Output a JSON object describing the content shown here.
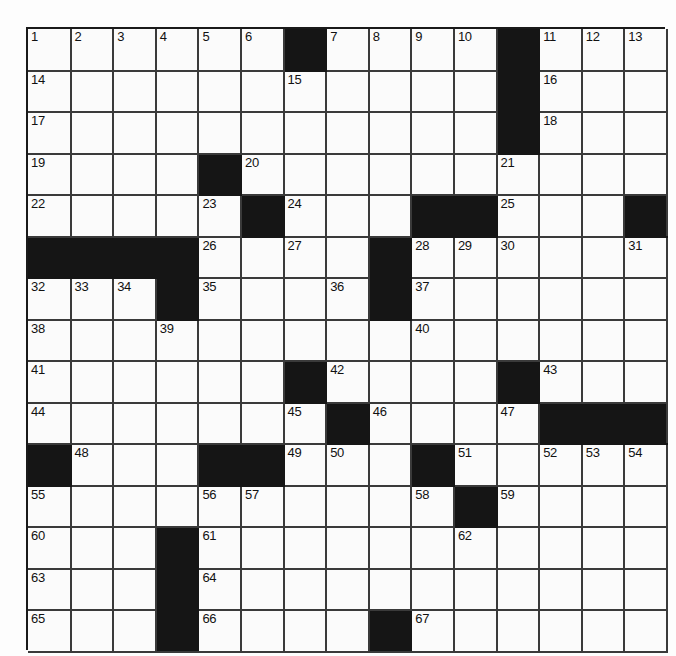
{
  "puzzle": {
    "title": "Crossword Puzzle Grid",
    "rows": 15,
    "cols": 15,
    "colors": {
      "block": "#151515",
      "cell": "#fbfbfb",
      "grid_line": "#3a3a3a",
      "page_background": "#ffffff",
      "number_text": "#111111"
    },
    "highest_number": 67,
    "grid": [
      [
        {
          "n": "1"
        },
        {
          "n": "2"
        },
        {
          "n": "3"
        },
        {
          "n": "4"
        },
        {
          "n": "5"
        },
        {
          "n": "6"
        },
        {
          "b": true
        },
        {
          "n": "7"
        },
        {
          "n": "8"
        },
        {
          "n": "9"
        },
        {
          "n": "10"
        },
        {
          "b": true
        },
        {
          "n": "11"
        },
        {
          "n": "12"
        },
        {
          "n": "13"
        }
      ],
      [
        {
          "n": "14"
        },
        {},
        {},
        {},
        {},
        {},
        {
          "n": "15"
        },
        {},
        {},
        {},
        {},
        {
          "b": true
        },
        {
          "n": "16"
        },
        {},
        {}
      ],
      [
        {
          "n": "17"
        },
        {},
        {},
        {},
        {},
        {},
        {},
        {},
        {},
        {},
        {},
        {
          "b": true
        },
        {
          "n": "18"
        },
        {},
        {}
      ],
      [
        {
          "n": "19"
        },
        {},
        {},
        {},
        {
          "b": true
        },
        {
          "n": "20"
        },
        {},
        {},
        {},
        {},
        {},
        {
          "n": "21"
        },
        {},
        {},
        {}
      ],
      [
        {
          "n": "22"
        },
        {},
        {},
        {},
        {
          "n": "23"
        },
        {
          "b": true
        },
        {
          "n": "24"
        },
        {},
        {},
        {
          "b": true
        },
        {
          "b": true
        },
        {
          "n": "25"
        },
        {},
        {},
        {
          "b": true
        }
      ],
      [
        {
          "b": true
        },
        {
          "b": true
        },
        {
          "b": true
        },
        {
          "b": true
        },
        {
          "n": "26"
        },
        {},
        {
          "n": "27"
        },
        {},
        {
          "b": true
        },
        {
          "n": "28"
        },
        {
          "n": "29"
        },
        {
          "n": "30"
        },
        {},
        {},
        {
          "n": "31"
        }
      ],
      [
        {
          "n": "32"
        },
        {
          "n": "33"
        },
        {
          "n": "34"
        },
        {
          "b": true
        },
        {
          "n": "35"
        },
        {},
        {},
        {
          "n": "36"
        },
        {
          "b": true
        },
        {
          "n": "37"
        },
        {},
        {},
        {},
        {},
        {}
      ],
      [
        {
          "n": "38"
        },
        {},
        {},
        {
          "n": "39"
        },
        {},
        {},
        {},
        {},
        {},
        {
          "n": "40"
        },
        {},
        {},
        {},
        {},
        {}
      ],
      [
        {
          "n": "41"
        },
        {},
        {},
        {},
        {},
        {},
        {
          "b": true
        },
        {
          "n": "42"
        },
        {},
        {},
        {},
        {
          "b": true
        },
        {
          "n": "43"
        },
        {},
        {}
      ],
      [
        {
          "n": "44"
        },
        {},
        {},
        {},
        {},
        {},
        {
          "n": "45"
        },
        {
          "b": true
        },
        {
          "n": "46"
        },
        {},
        {},
        {
          "n": "47"
        },
        {
          "b": true
        },
        {
          "b": true
        },
        {
          "b": true
        }
      ],
      [
        {
          "b": true
        },
        {
          "n": "48"
        },
        {},
        {},
        {
          "b": true
        },
        {
          "b": true
        },
        {
          "n": "49"
        },
        {
          "n": "50"
        },
        {},
        {
          "b": true
        },
        {
          "n": "51"
        },
        {},
        {
          "n": "52"
        },
        {
          "n": "53"
        },
        {
          "n": "54"
        }
      ],
      [
        {
          "n": "55"
        },
        {},
        {},
        {},
        {
          "n": "56"
        },
        {
          "n": "57"
        },
        {},
        {},
        {},
        {
          "n": "58"
        },
        {
          "b": true
        },
        {
          "n": "59"
        },
        {},
        {},
        {}
      ],
      [
        {
          "n": "60"
        },
        {},
        {},
        {
          "b": true
        },
        {
          "n": "61"
        },
        {},
        {},
        {},
        {},
        {},
        {
          "n": "62"
        },
        {},
        {},
        {},
        {}
      ],
      [
        {
          "n": "63"
        },
        {},
        {},
        {
          "b": true
        },
        {
          "n": "64"
        },
        {},
        {},
        {},
        {},
        {},
        {},
        {},
        {},
        {},
        {}
      ],
      [
        {
          "n": "65"
        },
        {},
        {},
        {
          "b": true
        },
        {
          "n": "66"
        },
        {},
        {},
        {},
        {
          "b": true
        },
        {
          "n": "67"
        },
        {},
        {},
        {},
        {},
        {}
      ]
    ]
  }
}
